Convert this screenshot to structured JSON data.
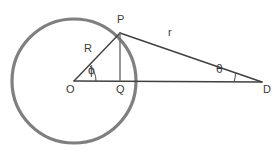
{
  "diagram": {
    "kind": "circle-tangent-triangle-diagram",
    "colors": {
      "circle_stroke": "#7f7f7f",
      "line_stroke": "#404040",
      "text": "#3a3a3a",
      "background": "#ffffff"
    },
    "circle": {
      "center_label": "O",
      "cx": 74,
      "cy": 81,
      "radius": 62,
      "stroke_width": 3
    },
    "points": [
      {
        "name": "O",
        "label": "O",
        "x": 74,
        "y": 81
      },
      {
        "name": "P",
        "label": "P",
        "x": 120,
        "y": 33
      },
      {
        "name": "Q",
        "label": "Q",
        "x": 120,
        "y": 81
      },
      {
        "name": "D",
        "label": "D",
        "x": 262,
        "y": 82
      }
    ],
    "segments": [
      {
        "name": "radius-OP",
        "label": "R",
        "from": "O",
        "to": "P",
        "stroke_width": 1.3
      },
      {
        "name": "distance-PD",
        "label": "r",
        "from": "P",
        "to": "D",
        "stroke_width": 1.3
      },
      {
        "name": "baseline-OD",
        "label": "",
        "from": "O",
        "to": "D",
        "stroke_width": 1.3
      },
      {
        "name": "perpendicular-PQ",
        "label": "",
        "from": "P",
        "to": "Q",
        "stroke_width": 1.3
      }
    ],
    "angles": [
      {
        "name": "angle-phi-at-O",
        "label": "ϕ",
        "at": "O"
      },
      {
        "name": "angle-theta-at-D",
        "label": "θ",
        "at": "D"
      }
    ]
  }
}
